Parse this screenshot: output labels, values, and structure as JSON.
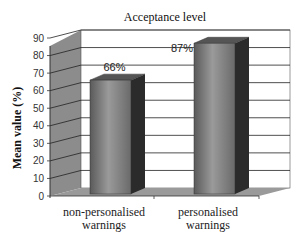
{
  "chart_data": {
    "type": "bar",
    "style": "3d-column",
    "title": "Acceptance level",
    "xlabel": "",
    "ylabel": "Mean value (%)",
    "categories": [
      "non-personalised warnings",
      "personalised warnings"
    ],
    "category_lines": [
      [
        "non-personalised",
        "warnings"
      ],
      [
        "personalised",
        "warnings"
      ]
    ],
    "values": [
      66,
      87
    ],
    "value_labels": [
      "66%",
      "87%"
    ],
    "ylim": [
      0,
      90
    ],
    "yticks": [
      0,
      10,
      20,
      30,
      40,
      50,
      60,
      70,
      80,
      90
    ],
    "grid": true,
    "legend": null,
    "colors": {
      "bar_front": "#7a7a7a",
      "bar_side": "#2b2b2b",
      "bar_top": "#555555",
      "wall_side": "#8c8c8c",
      "floor": "#9a9a9a",
      "back_wall": "#ffffff",
      "grid": "#222222"
    }
  }
}
